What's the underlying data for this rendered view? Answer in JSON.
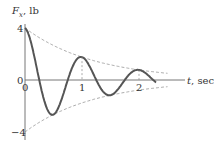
{
  "chart_data": {
    "type": "line",
    "title": "",
    "ylabel_var": "F",
    "ylabel_sub": "x",
    "ylabel_unit": ", lb",
    "xlabel_var": "t",
    "xlabel_unit": ", sec",
    "xlim": [
      0,
      2.5
    ],
    "ylim": [
      -4,
      4
    ],
    "x_ticks": [
      {
        "value": 0,
        "label": "0"
      },
      {
        "value": 1,
        "label": "1"
      },
      {
        "value": 2,
        "label": "2"
      }
    ],
    "y_ticks": [
      {
        "value": 4,
        "label": "4"
      },
      {
        "value": 0,
        "label": "0"
      },
      {
        "value": -4,
        "label": "-4"
      }
    ],
    "grid": false,
    "series": [
      {
        "name": "F_x(t) damped oscillation",
        "style": "solid",
        "amplitude": 4,
        "decay": 0.82,
        "frequency_hz": 1,
        "t_end": 2.3,
        "points": [
          [
            0,
            4
          ],
          [
            0.25,
            0
          ],
          [
            0.5,
            -2.6
          ],
          [
            0.75,
            0
          ],
          [
            1,
            1.76
          ],
          [
            1.25,
            0
          ],
          [
            1.5,
            -1.17
          ],
          [
            1.75,
            0
          ],
          [
            2,
            0.78
          ],
          [
            2.25,
            0
          ]
        ]
      },
      {
        "name": "upper envelope",
        "style": "dashed",
        "t_end": 2.5,
        "points": [
          [
            0,
            4
          ],
          [
            1,
            1.76
          ],
          [
            2,
            0.78
          ],
          [
            2.5,
            0.52
          ]
        ]
      },
      {
        "name": "lower envelope",
        "style": "dashed",
        "t_end": 2.5,
        "points": [
          [
            0,
            -4
          ],
          [
            1,
            -1.76
          ],
          [
            2,
            -0.78
          ],
          [
            2.5,
            -0.52
          ]
        ]
      }
    ]
  },
  "colors": {
    "curve": "#555555",
    "axis": "#777777",
    "envelope": "#888888"
  }
}
